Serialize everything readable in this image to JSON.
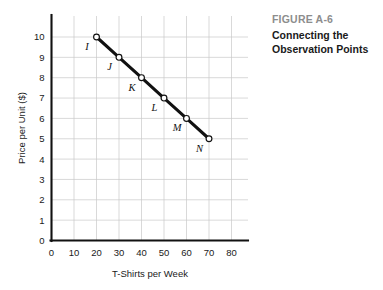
{
  "caption": {
    "figure_number": "FIGURE A-6",
    "title_line_1": "Connecting the",
    "title_line_2": "Observation Points"
  },
  "colors": {
    "figure_number": "#8d8d8d",
    "title": "#1a1a1a",
    "axis": "#111111",
    "grid": "#c9c9c9",
    "line": "#111111",
    "point_fill": "#ffffff",
    "background": "#ffffff"
  },
  "chart_data": {
    "type": "line",
    "title": "Connecting the Observation Points",
    "subtitle": "FIGURE A-6",
    "xlabel": "T-Shirts per Week",
    "ylabel": "Price per Unit ($)",
    "xlim": [
      0,
      80
    ],
    "ylim": [
      0,
      10.7
    ],
    "xticks": [
      0,
      10,
      20,
      30,
      40,
      50,
      60,
      70,
      80
    ],
    "xtick_labels": [
      "0",
      "10",
      "20",
      "30",
      "40",
      "50",
      "60",
      "70",
      "80"
    ],
    "yticks": [
      0,
      1,
      2,
      3,
      4,
      5,
      6,
      7,
      8,
      9,
      10
    ],
    "ytick_labels": [
      "0",
      "1",
      "2",
      "3",
      "4",
      "5",
      "6",
      "7",
      "8",
      "9",
      "10"
    ],
    "grid": "horizontal-and-vertical",
    "legend": "none",
    "marker": "open-circle",
    "x": [
      20,
      30,
      40,
      50,
      60,
      70
    ],
    "values": [
      10,
      9,
      8,
      7,
      6,
      5
    ],
    "point_labels": [
      "I",
      "J",
      "K",
      "L",
      "M",
      "N"
    ],
    "points": [
      {
        "label": "I",
        "x": 20,
        "y": 10
      },
      {
        "label": "J",
        "x": 30,
        "y": 9
      },
      {
        "label": "K",
        "x": 40,
        "y": 8
      },
      {
        "label": "L",
        "x": 50,
        "y": 7
      },
      {
        "label": "M",
        "x": 60,
        "y": 6
      },
      {
        "label": "N",
        "x": 70,
        "y": 5
      }
    ]
  }
}
